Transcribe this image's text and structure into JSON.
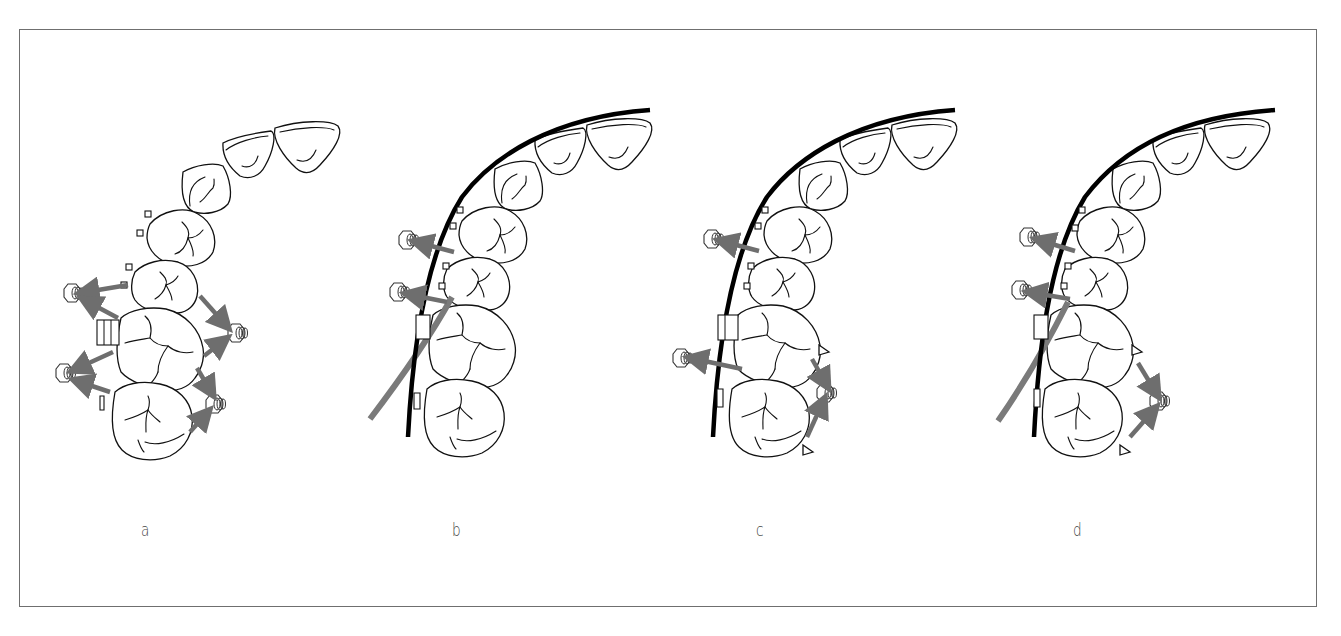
{
  "figure": {
    "colors": {
      "background": "#ffffff",
      "frame": "#6f6f6f",
      "outline": "#111111",
      "archwire": "#000000",
      "force_arrow": "#6e6e6e",
      "label_text": "#444444"
    },
    "panels": [
      {
        "id": "a",
        "label": "a",
        "archwire": false,
        "elastic_auxiliary": false,
        "buccal_screws": 2,
        "palatal_screws": 2,
        "arrows": [
          "premolar-to-buccal-screw",
          "molar1-to-buccal-screw-upper",
          "molar1-to-buccal-screw-lower",
          "molar2-to-buccal-screw",
          "premolar-to-palatal-screw",
          "molar1-to-palatal-screw-upper",
          "molar1-to-palatal-screw-lower",
          "molar2-to-palatal-screw"
        ]
      },
      {
        "id": "b",
        "label": "b",
        "archwire": true,
        "elastic_auxiliary": true,
        "buccal_screws": 2,
        "palatal_screws": 0,
        "arrows": [
          "premolar1-to-buccal-screw",
          "premolar2-to-buccal-screw"
        ]
      },
      {
        "id": "c",
        "label": "c",
        "archwire": true,
        "elastic_auxiliary": false,
        "buccal_screws": 2,
        "palatal_screws": 1,
        "arrows": [
          "premolar1-to-buccal-screw",
          "molar1-to-buccal-screw",
          "molar1-to-palatal-screw",
          "molar2-to-palatal-screw"
        ]
      },
      {
        "id": "d",
        "label": "d",
        "archwire": true,
        "elastic_auxiliary": true,
        "buccal_screws": 2,
        "palatal_screws": 1,
        "arrows": [
          "premolar1-to-buccal-screw",
          "premolar2-to-buccal-screw",
          "molar1-to-palatal-screw",
          "molar2-to-palatal-screw"
        ]
      }
    ]
  }
}
